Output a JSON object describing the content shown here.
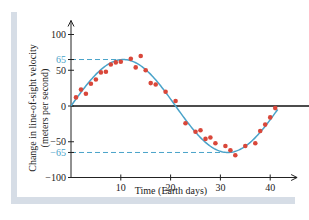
{
  "chart_data": {
    "type": "scatter",
    "title": "",
    "xlabel": "Time (Earth days)",
    "ylabel_line1": "Change in line-of-sight velocity",
    "ylabel_line2": "(meters per second)",
    "xlim": [
      0,
      45
    ],
    "ylim": [
      -100,
      100
    ],
    "x_ticks": [
      10,
      20,
      30,
      40
    ],
    "y_ticks": [
      100,
      50,
      0,
      -50,
      -100
    ],
    "y_tick_labels": [
      "100",
      "50",
      "0",
      "−50",
      "−100"
    ],
    "reference_lines": [
      {
        "value": 65,
        "label": "65"
      },
      {
        "value": -65,
        "label": "−65"
      }
    ],
    "grid": false,
    "legend": null,
    "fit_curve": {
      "name": "sinusoidal fit",
      "amplitude": 65,
      "period_days": 42,
      "phase_zero_day": 0.5,
      "color": "#4aa3c9"
    },
    "series": [
      {
        "name": "measurements",
        "color": "#d9473a",
        "points": [
          [
            1,
            12
          ],
          [
            2,
            23
          ],
          [
            3,
            17
          ],
          [
            4,
            31
          ],
          [
            5,
            37
          ],
          [
            6,
            47
          ],
          [
            7,
            48
          ],
          [
            8,
            58
          ],
          [
            9,
            61
          ],
          [
            10,
            62
          ],
          [
            12,
            66
          ],
          [
            13,
            54
          ],
          [
            14,
            70
          ],
          [
            15,
            50
          ],
          [
            16,
            32
          ],
          [
            17,
            30
          ],
          [
            19,
            20
          ],
          [
            21,
            7
          ],
          [
            23,
            -24
          ],
          [
            25,
            -36
          ],
          [
            26,
            -34
          ],
          [
            27,
            -46
          ],
          [
            28,
            -44
          ],
          [
            29,
            -52
          ],
          [
            31,
            -56
          ],
          [
            32,
            -62
          ],
          [
            33,
            -69
          ],
          [
            35,
            -56
          ],
          [
            37,
            -52
          ],
          [
            38,
            -35
          ],
          [
            39,
            -26
          ],
          [
            40,
            -16
          ],
          [
            41,
            -3
          ]
        ]
      }
    ]
  },
  "colors": {
    "axis": "#222222",
    "zero_line": "#111111",
    "fit": "#4aa3c9",
    "points": "#d9473a",
    "frame": "#d6dde6"
  }
}
